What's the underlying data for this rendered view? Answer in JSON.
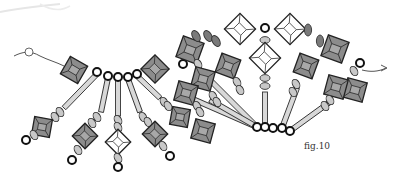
{
  "figure": {
    "label": "fig.10"
  },
  "colors": {
    "outline": "#222222",
    "crystal_dark": "#8c8c8c",
    "crystal_light": "#ffffff",
    "seed": "#c8c8c8",
    "oval": "#7a7a7a",
    "ring": "#111111",
    "thread": "#555555",
    "bugle": "#d8d8d8"
  },
  "legend": {
    "elements": [
      "crystal-bicone-dark",
      "crystal-bicone-light",
      "seed-bead",
      "bugle-bead",
      "ring-bead",
      "oval-drop-bead",
      "thread"
    ]
  }
}
